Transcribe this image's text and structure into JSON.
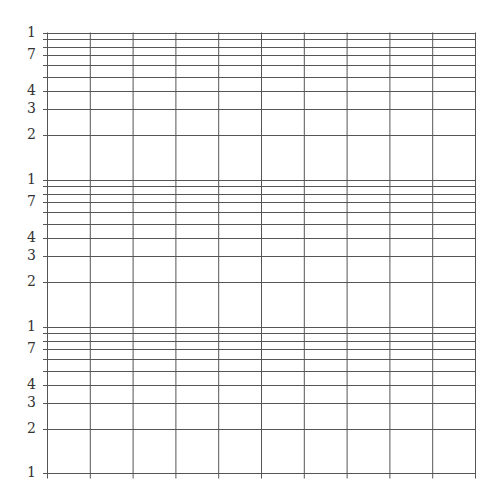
{
  "paper": {
    "type": "semi-log graph paper",
    "cycles": 3,
    "vertical_divisions": 10,
    "line_color": "#555555",
    "label_color": "#333333",
    "decade_labels": [
      {
        "value": 10,
        "label": "1",
        "minor": false
      },
      {
        "value": 9,
        "label": "",
        "minor": true
      },
      {
        "value": 8,
        "label": "",
        "minor": true
      },
      {
        "value": 7,
        "label": "7",
        "minor": false
      },
      {
        "value": 6,
        "label": "",
        "minor": true
      },
      {
        "value": 5,
        "label": "",
        "minor": true
      },
      {
        "value": 4,
        "label": "4",
        "minor": false
      },
      {
        "value": 3,
        "label": "3",
        "minor": false
      },
      {
        "value": 2,
        "label": "2",
        "minor": false
      }
    ],
    "bottom_label": "1"
  },
  "chart_data": {
    "type": "table",
    "title": "",
    "xlabel": "",
    "ylabel": "",
    "y_scale": "log",
    "y_cycles": 3,
    "y_tick_labels": [
      "1",
      "7",
      "4",
      "3",
      "2",
      "1",
      "7",
      "4",
      "3",
      "2",
      "1",
      "7",
      "4",
      "3",
      "2",
      "1"
    ],
    "x_grid_lines": 11,
    "grid": true
  }
}
